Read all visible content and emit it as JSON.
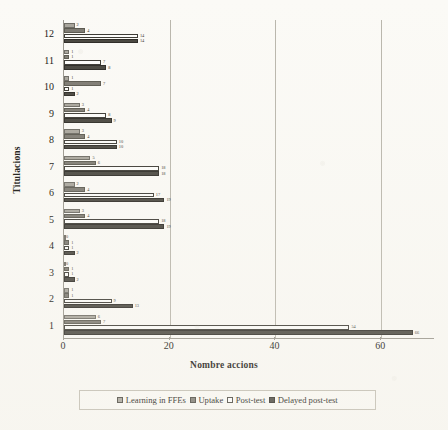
{
  "chart_data": {
    "type": "bar",
    "orientation": "horizontal",
    "title": "",
    "xlabel": "Nombre accions",
    "ylabel": "Titulacions",
    "categories": [
      "1",
      "2",
      "3",
      "4",
      "5",
      "6",
      "7",
      "8",
      "9",
      "10",
      "11",
      "12"
    ],
    "xlim": [
      0,
      70
    ],
    "xticks": [
      0,
      20,
      40,
      60
    ],
    "xtick_labels": [
      "0",
      "20",
      "40",
      "60"
    ],
    "grid": true,
    "grid_axis": "x",
    "legend_position": "bottom",
    "series": [
      {
        "name": "Learning in FFEs",
        "color": "#a8a59c",
        "values": [
          6,
          1,
          0,
          0,
          3,
          2,
          5,
          3,
          3,
          1,
          1,
          2
        ]
      },
      {
        "name": "Uptake",
        "color": "#7d7a72",
        "values": [
          7,
          1,
          1,
          1,
          4,
          4,
          6,
          4,
          4,
          7,
          1,
          4
        ]
      },
      {
        "name": "Post-test",
        "color": "#ffffff",
        "values": [
          54,
          9,
          1,
          1,
          18,
          17,
          18,
          10,
          8,
          1,
          7,
          14
        ]
      },
      {
        "name": "Delayed post-test",
        "color": "#47453e",
        "values": [
          66,
          13,
          2,
          2,
          19,
          19,
          18,
          10,
          9,
          2,
          8,
          14
        ]
      }
    ],
    "value_labels": {
      "1": [
        "6",
        "7",
        "54",
        "66"
      ],
      "2": [
        "1",
        "1",
        "9",
        "13"
      ],
      "3": [
        "0",
        "1",
        "1",
        "2"
      ],
      "4": [
        "0",
        "1",
        "1",
        "2"
      ],
      "5": [
        "3",
        "4",
        "18",
        "19"
      ],
      "6": [
        "2",
        "4",
        "17",
        "19"
      ],
      "7": [
        "5",
        "6",
        "18",
        "18"
      ],
      "8": [
        "3",
        "4",
        "10",
        "10"
      ],
      "9": [
        "3",
        "4",
        "8",
        "9"
      ],
      "10": [
        "1",
        "7",
        "1",
        "2"
      ],
      "11": [
        "1",
        "1",
        "7",
        "8"
      ],
      "12": [
        "2",
        "4",
        "14",
        "14"
      ]
    }
  },
  "axes": {
    "y_title": "Titulacions",
    "x_title": "Nombre accions"
  },
  "legend": {
    "items": [
      {
        "label": "Learning in FFEs",
        "swatch": "s0"
      },
      {
        "label": "Uptake",
        "swatch": "s1"
      },
      {
        "label": "Post-test",
        "swatch": "s2"
      },
      {
        "label": "Delayed post-test",
        "swatch": "s3"
      }
    ]
  },
  "colors": {
    "series_0": "#a8a59c",
    "series_1": "#7d7a72",
    "series_2": "#ffffff",
    "series_3": "#47453e",
    "axis": "#9a978e",
    "grid": "#b9b6ac",
    "background": "#fbfaf6"
  }
}
